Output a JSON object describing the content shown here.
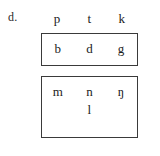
{
  "figure": {
    "item_label": "d.",
    "background_color": "#ffffff",
    "text_color": "#1c1c1c",
    "box_border_color": "#3a3a3a",
    "rows": [
      {
        "name": "voiceless-stops",
        "boxed": false,
        "phones": [
          "p",
          "t",
          "k"
        ]
      },
      {
        "name": "voiced-stops",
        "boxed": true,
        "phones": [
          "b",
          "d",
          "g"
        ]
      },
      {
        "name": "nasals",
        "boxed": true,
        "phones": [
          "m",
          "n",
          "ŋ"
        ]
      },
      {
        "name": "lateral",
        "boxed": true,
        "phones": [
          "l"
        ]
      }
    ]
  }
}
